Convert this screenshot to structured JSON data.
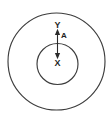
{
  "diagram": {
    "background_color": "#ffffff",
    "stroke_color": "#3d3d3d",
    "label_color": "#1f1f1f",
    "shapes": {
      "outer_circle": {
        "name": "outer-circle",
        "cx": 56.5,
        "cy": 61.5,
        "r": 48.5
      },
      "inner_circle": {
        "name": "inner-circle",
        "cx": 57.5,
        "cy": 64,
        "r": 20.5
      }
    },
    "arrow": {
      "name": "double-headed-vertical-arrow",
      "x": 57.5,
      "y_top": 30,
      "y_bottom": 58,
      "heads": "both",
      "label": "A",
      "label_x": 64,
      "label_y": 35.5
    },
    "labels": [
      {
        "text": "Y",
        "x": 57.5,
        "y": 25.5,
        "region": "annulus"
      },
      {
        "text": "A",
        "x": 64,
        "y": 35.5,
        "region": "arrow-measure"
      },
      {
        "text": "X",
        "x": 57.5,
        "y": 63.5,
        "region": "inner-circle"
      }
    ]
  }
}
